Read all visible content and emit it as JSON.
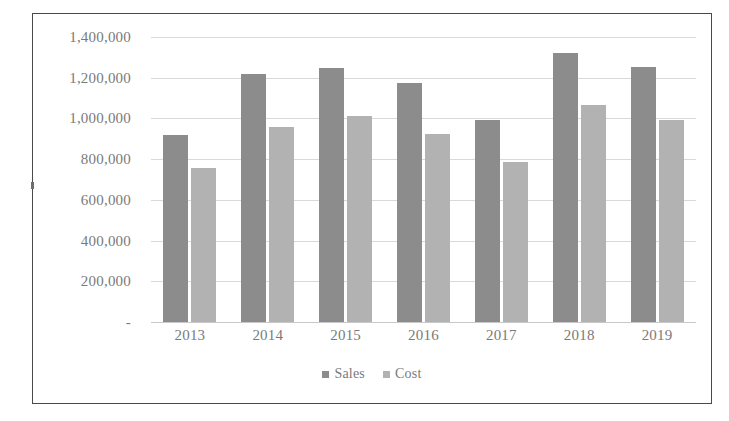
{
  "chart_data": {
    "type": "bar",
    "title": "",
    "xlabel": "",
    "ylabel": "",
    "categories": [
      "2013",
      "2014",
      "2015",
      "2016",
      "2017",
      "2018",
      "2019"
    ],
    "series": [
      {
        "name": "Sales",
        "color": "#8c8c8c",
        "values": [
          920000,
          1220000,
          1250000,
          1175000,
          990000,
          1320000,
          1255000
        ]
      },
      {
        "name": "Cost",
        "color": "#b2b2b2",
        "values": [
          755000,
          960000,
          1010000,
          925000,
          785000,
          1065000,
          990000
        ]
      }
    ],
    "ylim": [
      0,
      1400000
    ],
    "ytick_values": [
      1400000,
      1200000,
      1000000,
      800000,
      600000,
      400000,
      200000,
      0
    ],
    "ytick_labels": [
      "1,400,000",
      "1,200,000",
      "1,000,000",
      "800,000",
      "600,000",
      "400,000",
      "200,000",
      " -   "
    ],
    "grid": true,
    "legend_position": "bottom",
    "legend": [
      "Sales",
      "Cost"
    ]
  },
  "colors": {
    "sales": "#8c8c8c",
    "cost": "#b2b2b2",
    "gridline": "#d9d9d9",
    "text": "#7a7a7a",
    "border": "#4a4a4a"
  }
}
